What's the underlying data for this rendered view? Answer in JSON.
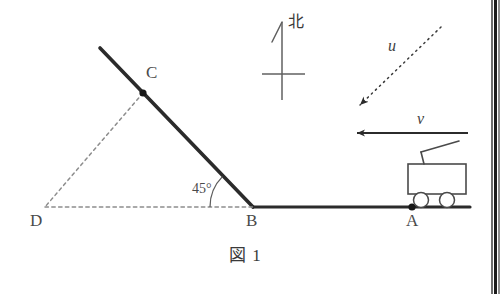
{
  "figure": {
    "caption": "図 1",
    "compass": {
      "label": "北",
      "meaning": "north"
    },
    "points": [
      {
        "id": "A",
        "label": "A",
        "x": 412,
        "y": 207
      },
      {
        "id": "B",
        "label": "B",
        "x": 253,
        "y": 207
      },
      {
        "id": "C",
        "label": "C",
        "x": 143,
        "y": 93
      },
      {
        "id": "D",
        "label": "D",
        "x": 45,
        "y": 207
      }
    ],
    "angle": {
      "label": "45°",
      "value": 45,
      "vertex": "B"
    },
    "vectors": [
      {
        "id": "u",
        "label": "u",
        "style": "dashed",
        "direction": "down-left",
        "from_x": 441,
        "from_y": 27,
        "to_x": 358,
        "to_y": 107
      },
      {
        "id": "v",
        "label": "v",
        "style": "solid",
        "direction": "left",
        "from_x": 468,
        "from_y": 133,
        "to_x": 354,
        "to_y": 133
      }
    ],
    "vehicle": {
      "name": "tram-cart",
      "at_point": "A"
    },
    "colors": {
      "ink": "#2b2b2b",
      "ink_light": "#6a6a6a",
      "dash": "#8a8a8a",
      "paper": "#ffffff"
    }
  }
}
